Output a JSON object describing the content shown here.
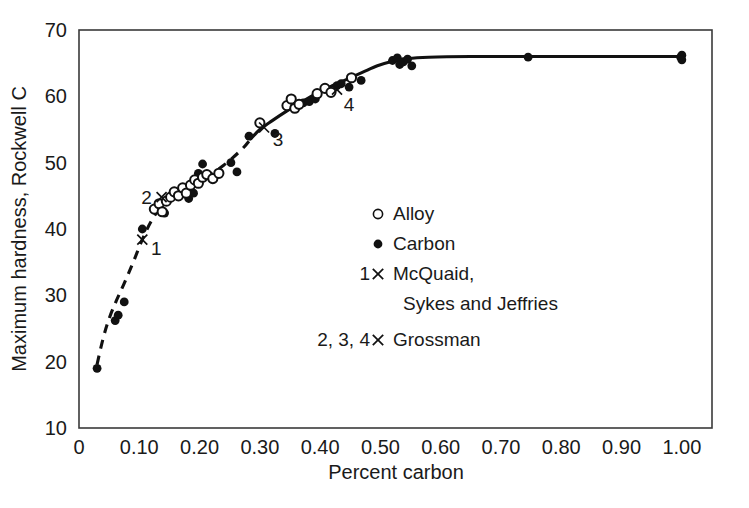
{
  "chart_data": {
    "type": "scatter",
    "title": "",
    "xlabel": "Percent carbon",
    "ylabel": "Maximum hardness, Rockwell C",
    "xlim": [
      0.0,
      1.05
    ],
    "ylim": [
      10,
      70
    ],
    "xticks": [
      "0",
      "0.10",
      "0.20",
      "0.30",
      "0.40",
      "0.50",
      "0.60",
      "0.70",
      "0.80",
      "0.90",
      "1.00"
    ],
    "xtick_values": [
      0.0,
      0.1,
      0.2,
      0.3,
      0.4,
      0.5,
      0.6,
      0.7,
      0.8,
      0.9,
      1.0
    ],
    "yticks": [
      "10",
      "20",
      "30",
      "40",
      "50",
      "60",
      "70"
    ],
    "ytick_values": [
      10,
      20,
      30,
      40,
      50,
      60,
      70
    ],
    "grid": false,
    "legend_position": "center-right",
    "series": [
      {
        "name": "Alloy",
        "marker": "open-circle",
        "points": [
          [
            0.125,
            43.0
          ],
          [
            0.133,
            43.8
          ],
          [
            0.138,
            42.6
          ],
          [
            0.145,
            44.2
          ],
          [
            0.152,
            44.8
          ],
          [
            0.158,
            45.6
          ],
          [
            0.165,
            45.0
          ],
          [
            0.172,
            46.2
          ],
          [
            0.178,
            45.4
          ],
          [
            0.185,
            46.6
          ],
          [
            0.192,
            47.4
          ],
          [
            0.198,
            46.9
          ],
          [
            0.205,
            47.8
          ],
          [
            0.212,
            48.2
          ],
          [
            0.222,
            47.6
          ],
          [
            0.232,
            48.4
          ],
          [
            0.3,
            56.0
          ],
          [
            0.345,
            58.6
          ],
          [
            0.352,
            59.6
          ],
          [
            0.358,
            58.2
          ],
          [
            0.365,
            58.8
          ],
          [
            0.395,
            60.4
          ],
          [
            0.408,
            61.2
          ],
          [
            0.418,
            60.6
          ],
          [
            0.452,
            62.8
          ]
        ]
      },
      {
        "name": "Carbon",
        "marker": "filled-circle",
        "points": [
          [
            0.03,
            19.0
          ],
          [
            0.06,
            26.2
          ],
          [
            0.065,
            27.0
          ],
          [
            0.075,
            29.0
          ],
          [
            0.105,
            40.0
          ],
          [
            0.142,
            42.4
          ],
          [
            0.168,
            45.2
          ],
          [
            0.175,
            45.8
          ],
          [
            0.182,
            44.6
          ],
          [
            0.19,
            45.4
          ],
          [
            0.198,
            48.4
          ],
          [
            0.205,
            49.8
          ],
          [
            0.215,
            48.0
          ],
          [
            0.252,
            50.0
          ],
          [
            0.262,
            48.6
          ],
          [
            0.282,
            54.0
          ],
          [
            0.325,
            54.4
          ],
          [
            0.372,
            59.0
          ],
          [
            0.382,
            59.2
          ],
          [
            0.392,
            59.6
          ],
          [
            0.428,
            61.6
          ],
          [
            0.435,
            61.9
          ],
          [
            0.448,
            61.4
          ],
          [
            0.468,
            62.4
          ],
          [
            0.52,
            65.4
          ],
          [
            0.528,
            65.8
          ],
          [
            0.532,
            64.8
          ],
          [
            0.538,
            65.2
          ],
          [
            0.545,
            65.6
          ],
          [
            0.552,
            64.6
          ],
          [
            0.745,
            65.9
          ],
          [
            0.998,
            65.9
          ],
          [
            1.0,
            66.2
          ],
          [
            1.0,
            65.5
          ]
        ]
      }
    ],
    "annotations": [
      {
        "label": "1",
        "marker": "cross",
        "x": 0.105,
        "y": 38.4,
        "label_x": 0.128,
        "label_y": 37.2
      },
      {
        "label": "2",
        "marker": "cross",
        "x": 0.137,
        "y": 44.8,
        "label_x": 0.112,
        "label_y": 44.8
      },
      {
        "label": "3",
        "marker": "cross",
        "x": 0.307,
        "y": 55.3,
        "label_x": 0.33,
        "label_y": 53.6
      },
      {
        "label": "4",
        "marker": "cross",
        "x": 0.428,
        "y": 61.0,
        "label_x": 0.448,
        "label_y": 58.8
      }
    ],
    "curve": {
      "dashed_segment": [
        [
          0.03,
          19.6
        ],
        [
          0.04,
          23.5
        ],
        [
          0.05,
          26.5
        ],
        [
          0.062,
          29.2
        ],
        [
          0.075,
          31.8
        ],
        [
          0.09,
          35.0
        ],
        [
          0.105,
          38.4
        ],
        [
          0.12,
          41.2
        ],
        [
          0.135,
          43.2
        ],
        [
          0.15,
          44.4
        ],
        [
          0.17,
          45.6
        ],
        [
          0.19,
          46.6
        ],
        [
          0.21,
          47.8
        ],
        [
          0.24,
          49.6
        ],
        [
          0.27,
          52.0
        ],
        [
          0.285,
          53.6
        ]
      ],
      "solid_segment": [
        [
          0.285,
          53.6
        ],
        [
          0.3,
          55.0
        ],
        [
          0.32,
          56.3
        ],
        [
          0.345,
          57.8
        ],
        [
          0.37,
          59.2
        ],
        [
          0.395,
          60.5
        ],
        [
          0.42,
          61.6
        ],
        [
          0.445,
          62.6
        ],
        [
          0.47,
          63.6
        ],
        [
          0.495,
          64.6
        ],
        [
          0.52,
          65.3
        ],
        [
          0.545,
          65.7
        ],
        [
          0.58,
          65.9
        ],
        [
          0.65,
          66.0
        ],
        [
          0.745,
          66.0
        ],
        [
          0.85,
          66.0
        ],
        [
          1.0,
          66.0
        ]
      ]
    },
    "legend": {
      "entries": [
        {
          "key": "",
          "marker": "open-circle",
          "label": "Alloy"
        },
        {
          "key": "",
          "marker": "filled-circle",
          "label": "Carbon"
        },
        {
          "key": "1",
          "marker": "cross",
          "label": "McQuaid,",
          "label2": "Sykes and Jeffries"
        },
        {
          "key": "2, 3, 4",
          "marker": "cross",
          "label": "Grossman"
        }
      ]
    },
    "colors": {
      "data": "#111111",
      "frame": "#3a3a3a",
      "background": "#ffffff"
    }
  }
}
